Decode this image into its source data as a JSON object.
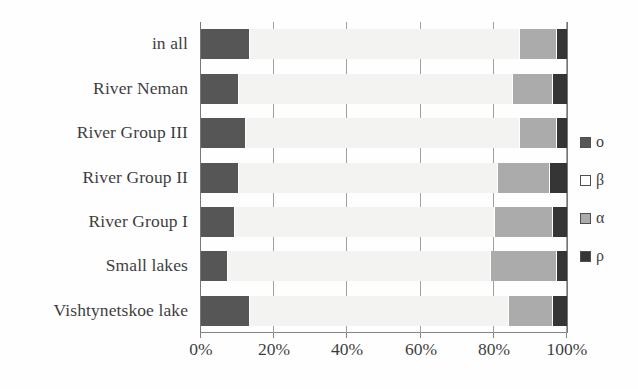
{
  "chart_data": {
    "type": "bar",
    "orientation": "horizontal",
    "stacked": true,
    "normalized_percent": true,
    "title": "",
    "subtitle": "",
    "xlabel": "",
    "ylabel": "",
    "xlim": [
      0,
      100
    ],
    "xticks": [
      0,
      20,
      40,
      60,
      80,
      100
    ],
    "xtick_labels": [
      "0%",
      "20%",
      "40%",
      "60%",
      "80%",
      "100%"
    ],
    "grid": true,
    "grid_axis": "x",
    "legend_position": "right",
    "categories": [
      "in all",
      "River Neman",
      "River Group III",
      "River Group II",
      "River Group I",
      "Small lakes",
      "Vishtynetskoe lake"
    ],
    "series": [
      {
        "name": "o",
        "color": "#333333",
        "values": [
          13,
          10,
          12,
          10,
          9,
          7,
          13
        ]
      },
      {
        "name": "β",
        "color": "#f2f2f0",
        "values": [
          74,
          75,
          75,
          71,
          71,
          72,
          71
        ]
      },
      {
        "name": "α",
        "color": "#9a9a9a",
        "values": [
          10,
          11,
          10,
          14,
          16,
          18,
          12
        ]
      },
      {
        "name": "ρ",
        "color": "#0a0a0a",
        "values": [
          3,
          4,
          3,
          5,
          4,
          3,
          4
        ]
      }
    ]
  },
  "axis": {
    "tick_labels": [
      "0%",
      "20%",
      "40%",
      "60%",
      "80%",
      "100%"
    ]
  },
  "categories": {
    "labels": [
      "in all",
      "River Neman",
      "River Group III",
      "River Group II",
      "River Group I",
      "Small lakes",
      "Vishtynetskoe lake"
    ]
  },
  "legend": {
    "items": [
      {
        "label": "o",
        "swatch": "dark-gray-square-icon",
        "color": "#333333"
      },
      {
        "label": "β",
        "swatch": "white-square-icon",
        "color": "#ffffff"
      },
      {
        "label": "α",
        "swatch": "gray-square-icon",
        "color": "#9a9a9a"
      },
      {
        "label": "ρ",
        "swatch": "black-square-icon",
        "color": "#0a0a0a"
      }
    ]
  },
  "colors": {
    "series_o": "#333333",
    "series_beta": "#f2f2f0",
    "series_alpha": "#9a9a9a",
    "series_rho": "#0a0a0a",
    "axis": "#5b5b5b",
    "grid": "#8d8d8d",
    "text": "#111111",
    "background": "#ffffff"
  }
}
